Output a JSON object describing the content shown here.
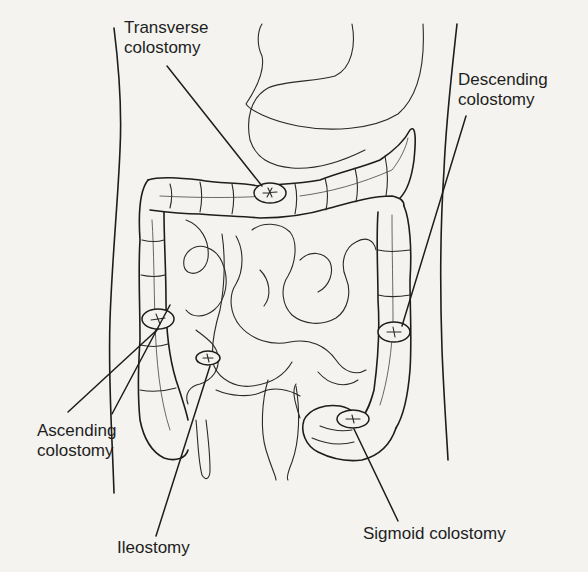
{
  "figure": {
    "labels": {
      "transverse": [
        "Transverse",
        "colostomy"
      ],
      "descending": [
        "Descending",
        "colostomy"
      ],
      "ascending": [
        "Ascending",
        "colostomy"
      ],
      "ileostomy": [
        "Ileostomy"
      ],
      "sigmoid": [
        "Sigmoid colostomy"
      ]
    },
    "icons": {
      "stoma": "stoma-icon"
    },
    "colors": {
      "background": "#f4f3ef",
      "ink": "#1d1d1d"
    }
  }
}
